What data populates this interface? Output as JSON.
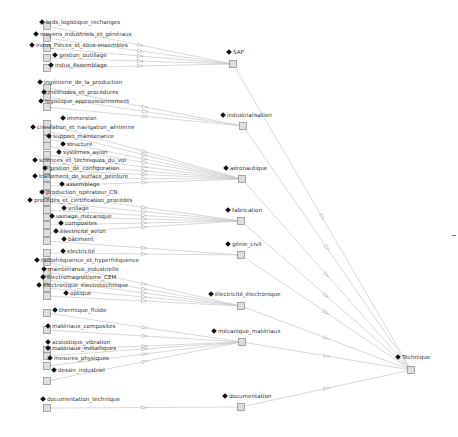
{
  "diagram": {
    "type": "hierarchy-graph",
    "root": {
      "label": "Technique",
      "x": 411,
      "y": 370
    },
    "categories": [
      {
        "label": "SAP",
        "x": 233,
        "y": 64,
        "children": [
          {
            "label": "brds_logistique_rechanges",
            "x": 47,
            "y": 26
          },
          {
            "label": "moyens_industriels_et_généraux",
            "x": 47,
            "y": 38
          },
          {
            "label": "indus_Pièces_et_sous-ensembles",
            "x": 47,
            "y": 48
          },
          {
            "label": "gestion_outillage",
            "x": 47,
            "y": 58
          },
          {
            "label": "indus_Assemblage",
            "x": 47,
            "y": 68
          }
        ]
      },
      {
        "label": "industrialisation",
        "x": 243,
        "y": 126,
        "children": [
          {
            "label": "ingénierie_de_la_production",
            "x": 47,
            "y": 88
          },
          {
            "label": "méthodes_et_procédures",
            "x": 47,
            "y": 97
          },
          {
            "label": "logistique_approvisionnement",
            "x": 47,
            "y": 107
          }
        ]
      },
      {
        "label": "aéronautique",
        "x": 242,
        "y": 179,
        "children": [
          {
            "label": "immersion",
            "x": 47,
            "y": 124
          },
          {
            "label": "circulation_et_navigation_aérienne",
            "x": 47,
            "y": 131
          },
          {
            "label": "support_maintenance",
            "x": 47,
            "y": 139
          },
          {
            "label": "structure",
            "x": 47,
            "y": 146
          },
          {
            "label": "systèmes_avion",
            "x": 47,
            "y": 155
          },
          {
            "label": "sciences_et_techniques_du_vol",
            "x": 47,
            "y": 163
          },
          {
            "label": "gestion_de_configuration",
            "x": 47,
            "y": 170
          },
          {
            "label": "traitement_de_surface_peinture",
            "x": 47,
            "y": 178
          },
          {
            "label": "assemblage",
            "x": 47,
            "y": 186
          }
        ]
      },
      {
        "label": "fabrication",
        "x": 241,
        "y": 221,
        "children": [
          {
            "label": "production_opérateur_CN",
            "x": 47,
            "y": 194
          },
          {
            "label": "procédés_et_certification_procédés",
            "x": 47,
            "y": 202
          },
          {
            "label": "vrillage",
            "x": 47,
            "y": 210
          },
          {
            "label": "usinage_mécanique",
            "x": 47,
            "y": 217
          },
          {
            "label": "composites",
            "x": 47,
            "y": 225
          },
          {
            "label": "électricité_avion",
            "x": 47,
            "y": 233
          }
        ]
      },
      {
        "label": "génie_civil",
        "x": 241,
        "y": 255,
        "children": [
          {
            "label": "bâtiment",
            "x": 47,
            "y": 241
          },
          {
            "label": "electricité",
            "x": 47,
            "y": 253
          }
        ]
      },
      {
        "label": "électricité_électronique",
        "x": 241,
        "y": 306,
        "children": [
          {
            "label": "radiofréquence_et_hyperfréquence",
            "x": 47,
            "y": 262
          },
          {
            "label": "maintenance_industrielle",
            "x": 47,
            "y": 272
          },
          {
            "label": "électromagnétisme_CEM",
            "x": 47,
            "y": 280
          },
          {
            "label": "électronique_électrotechnique",
            "x": 47,
            "y": 288
          },
          {
            "label": "optique",
            "x": 47,
            "y": 296
          }
        ]
      },
      {
        "label": "mécanique_matériaux",
        "x": 242,
        "y": 342,
        "children": [
          {
            "label": "thermique_fluide",
            "x": 47,
            "y": 313
          },
          {
            "label": "matériaux_composites",
            "x": 47,
            "y": 330
          },
          {
            "label": "acoustique_vibration",
            "x": 47,
            "y": 350
          },
          {
            "label": "matériaux_métalliques",
            "x": 47,
            "y": 356
          },
          {
            "label": "mesures_physiques",
            "x": 47,
            "y": 366
          },
          {
            "label": "dessin_industriel",
            "x": 47,
            "y": 381
          }
        ]
      },
      {
        "label": "documentation",
        "x": 241,
        "y": 407,
        "children": [
          {
            "label": "documentation_technique",
            "x": 47,
            "y": 408
          }
        ]
      }
    ]
  },
  "leaf_labels": [
    {
      "text": "brds_logistique_rechanges",
      "x": 40,
      "y": 22
    },
    {
      "text": "moyens_industriels_et_généraux",
      "x": 34,
      "y": 34
    },
    {
      "text": "indus_Pièces_et_sous-ensembles",
      "x": 30,
      "y": 45
    },
    {
      "text": "gestion_outillage",
      "x": 53,
      "y": 55
    },
    {
      "text": "indus_Assemblage",
      "x": 49,
      "y": 65
    },
    {
      "text": "ingénierie_de_la_production",
      "x": 38,
      "y": 82
    },
    {
      "text": "méthodes_et_procédures",
      "x": 42,
      "y": 92
    },
    {
      "text": "logistique_approvisionnement",
      "x": 39,
      "y": 101
    },
    {
      "text": "immersion",
      "x": 61,
      "y": 118
    },
    {
      "text": "circulation_et_navigation_aérienne",
      "x": 31,
      "y": 127
    },
    {
      "text": "support_maintenance",
      "x": 47,
      "y": 136
    },
    {
      "text": "structure",
      "x": 61,
      "y": 144
    },
    {
      "text": "systèmes_avion",
      "x": 57,
      "y": 152
    },
    {
      "text": "sciences_et_techniques_du_vol",
      "x": 33,
      "y": 160
    },
    {
      "text": "gestion_de_configuration",
      "x": 43,
      "y": 168
    },
    {
      "text": "traitement_de_surface_peinture",
      "x": 33,
      "y": 176
    },
    {
      "text": "assemblage",
      "x": 60,
      "y": 184
    },
    {
      "text": "production_opérateur_CN",
      "x": 40,
      "y": 192
    },
    {
      "text": "procédés_et_certification_procédés",
      "x": 28,
      "y": 200
    },
    {
      "text": "vrillage",
      "x": 62,
      "y": 208
    },
    {
      "text": "usinage_mécanique",
      "x": 50,
      "y": 216
    },
    {
      "text": "composites",
      "x": 59,
      "y": 223
    },
    {
      "text": "électricité_avion",
      "x": 54,
      "y": 231
    },
    {
      "text": "bâtiment",
      "x": 62,
      "y": 239
    },
    {
      "text": "electricité",
      "x": 61,
      "y": 251
    },
    {
      "text": "radiofréquence_et_hyperfréquence",
      "x": 35,
      "y": 260
    },
    {
      "text": "maintenance_industrielle",
      "x": 42,
      "y": 269
    },
    {
      "text": "électromagnétisme_CEM",
      "x": 41,
      "y": 277
    },
    {
      "text": "électronique_électrotechnique",
      "x": 37,
      "y": 285
    },
    {
      "text": "optique",
      "x": 64,
      "y": 293
    },
    {
      "text": "thermique_fluide",
      "x": 53,
      "y": 310
    },
    {
      "text": "matériaux_composites",
      "x": 46,
      "y": 326
    },
    {
      "text": "acoustique_vibration",
      "x": 46,
      "y": 342
    },
    {
      "text": "matériaux_métalliques",
      "x": 46,
      "y": 348
    },
    {
      "text": "mesures_physiques",
      "x": 48,
      "y": 358
    },
    {
      "text": "dessin_industriel",
      "x": 52,
      "y": 370
    },
    {
      "text": "documentation_technique",
      "x": 41,
      "y": 399
    }
  ],
  "category_labels": [
    {
      "text": "SAP",
      "x": 227,
      "y": 52
    },
    {
      "text": "industrialisation",
      "x": 221,
      "y": 115
    },
    {
      "text": "aéronautique",
      "x": 224,
      "y": 168
    },
    {
      "text": "fabrication",
      "x": 226,
      "y": 210
    },
    {
      "text": "génie_civil",
      "x": 226,
      "y": 244
    },
    {
      "text": "électricité_électronique",
      "x": 209,
      "y": 294
    },
    {
      "text": "mécanique_matériaux",
      "x": 212,
      "y": 331
    },
    {
      "text": "documentation",
      "x": 223,
      "y": 396
    }
  ],
  "root_label": {
    "text": "Technique",
    "x": 396,
    "y": 357
  },
  "stray_mark": {
    "x": 452,
    "y": 235
  },
  "colors": {
    "edge": "#c8c8c8",
    "node_fill": "#dddddd",
    "node_border": "#888888",
    "label": "#333333",
    "marker": "#111111"
  }
}
